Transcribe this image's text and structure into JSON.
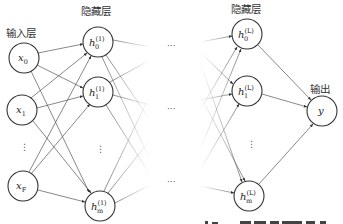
{
  "labels": {
    "input_layer": "输入层",
    "hidden_layer_1": "隐藏层",
    "hidden_layer_L": "隐藏层",
    "output_layer": "输出"
  },
  "nodes": {
    "input": [
      {
        "id": "x0",
        "base": "x",
        "sub": "0",
        "sup": ""
      },
      {
        "id": "x1",
        "base": "x",
        "sub": "1",
        "sup": ""
      },
      {
        "id": "xF",
        "base": "x",
        "sub": "F",
        "sup": ""
      }
    ],
    "hidden_first": [
      {
        "id": "h0_1",
        "base": "h",
        "sub": "0",
        "sup": "(1)"
      },
      {
        "id": "h1_1",
        "base": "h",
        "sub": "1",
        "sup": "(1)"
      },
      {
        "id": "hm_1",
        "base": "h",
        "sub": "m",
        "sup": "(1)"
      }
    ],
    "hidden_last": [
      {
        "id": "h0_L",
        "base": "h",
        "sub": "0",
        "sup": "(L)"
      },
      {
        "id": "h1_L",
        "base": "h",
        "sub": "1",
        "sup": "(L)"
      },
      {
        "id": "hm_L",
        "base": "h",
        "sub": "m",
        "sup": "(L)"
      }
    ],
    "output": [
      {
        "id": "y",
        "base": "y",
        "sub": "",
        "sup": ""
      }
    ]
  },
  "ellipses": {
    "vertical": "⋮",
    "horizontal": "···"
  }
}
